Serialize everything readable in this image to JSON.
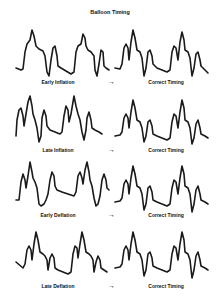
{
  "title": "Balloon Timing",
  "arrow_glyph": "→",
  "rows": [
    {
      "left_label": "Early Inflation",
      "right_label": "Correct Timing"
    },
    {
      "left_label": "Late Inflation",
      "right_label": "Correct Timing"
    },
    {
      "left_label": "Early Deflation",
      "right_label": "Correct Timing"
    },
    {
      "left_label": "Late Deflation",
      "right_label": "Correct Timing"
    }
  ],
  "colors": {
    "waveform": "#1a1a1a",
    "background": "#ffffff"
  }
}
